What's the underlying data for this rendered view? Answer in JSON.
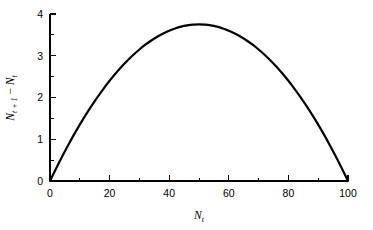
{
  "chart_data": {
    "type": "line",
    "title": "",
    "subtitle": "",
    "xlabel": "N_t",
    "ylabel": "N_t+1 − N_t",
    "xlabel_parts": {
      "symbol": "N",
      "subscript": "t"
    },
    "ylabel_parts": {
      "symbol1": "N",
      "subscript1": "t + 1",
      "operator": "−",
      "symbol2": "N",
      "subscript2": "t"
    },
    "xlim": [
      0,
      100
    ],
    "ylim": [
      0,
      4
    ],
    "xticks": [
      0,
      20,
      40,
      60,
      80,
      100
    ],
    "xticklabels": [
      "0",
      "20",
      "40",
      "60",
      "80",
      "100"
    ],
    "xminorticks": [
      10,
      30,
      50,
      70,
      90
    ],
    "yticks": [
      0,
      1,
      2,
      3,
      4
    ],
    "yticklabels": [
      "0",
      "1",
      "2",
      "3",
      "4"
    ],
    "yminorticks": [
      0.5,
      1.5,
      2.5,
      3.5
    ],
    "grid": false,
    "legend": null,
    "legend_position": "none",
    "line_color": "#000000",
    "background_color": "#ffffff",
    "peak": {
      "x": 50,
      "y": 3.75
    },
    "equation": "r*N*(1 - N/K), r = 0.15, K = 100",
    "x": [
      0,
      2,
      4,
      6,
      8,
      10,
      12,
      14,
      16,
      18,
      20,
      22,
      24,
      26,
      28,
      30,
      32,
      34,
      36,
      38,
      40,
      42,
      44,
      46,
      48,
      50,
      52,
      54,
      56,
      58,
      60,
      62,
      64,
      66,
      68,
      70,
      72,
      74,
      76,
      78,
      80,
      82,
      84,
      86,
      88,
      90,
      92,
      94,
      96,
      98,
      100
    ],
    "values": [
      0,
      0.294,
      0.576,
      0.846,
      1.104,
      1.35,
      1.584,
      1.806,
      2.016,
      2.214,
      2.4,
      2.574,
      2.736,
      2.886,
      3.024,
      3.15,
      3.264,
      3.366,
      3.456,
      3.534,
      3.6,
      3.654,
      3.696,
      3.726,
      3.744,
      3.75,
      3.744,
      3.726,
      3.696,
      3.654,
      3.6,
      3.534,
      3.456,
      3.366,
      3.264,
      3.15,
      3.024,
      2.886,
      2.736,
      2.574,
      2.4,
      2.214,
      2.016,
      1.806,
      1.584,
      1.35,
      1.104,
      0.846,
      0.576,
      0.294,
      0
    ]
  }
}
